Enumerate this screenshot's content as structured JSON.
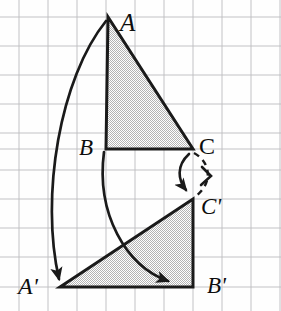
{
  "figure": {
    "width": 281,
    "height": 311,
    "background_color": "#fefefe",
    "grid": {
      "spacing": 29,
      "origin_x": 19,
      "origin_y": 17,
      "line_color": "#b9b9bd",
      "line_width": 0.9,
      "visible": true
    },
    "style": {
      "stroke_color": "#1a1a1a",
      "shape_stroke_width": 3.0,
      "arc_stroke_width": 2.6,
      "fill_color": "#d9d9d9",
      "fill_pattern": "checker-dither",
      "dash_pattern": "6 5"
    },
    "points": {
      "A": {
        "label": "A",
        "x": 108,
        "y": 17
      },
      "B": {
        "label": "B",
        "x": 106,
        "y": 149
      },
      "C": {
        "label": "C",
        "x": 193,
        "y": 149
      },
      "Ap": {
        "label": "A'",
        "x": 60,
        "y": 287
      },
      "Bp": {
        "label": "B'",
        "x": 193,
        "y": 287
      },
      "Cp": {
        "label": "C'",
        "x": 193,
        "y": 199
      }
    },
    "shapes": [
      {
        "name": "triangle-abc",
        "vertices": [
          "A",
          "B",
          "C"
        ],
        "filled": true
      },
      {
        "name": "triangle-apbpcp",
        "vertices": [
          "Ap",
          "Bp",
          "Cp"
        ],
        "filled": true
      }
    ],
    "arrows": [
      {
        "name": "arc-a-to-ap",
        "from": "A",
        "to": "Ap",
        "style": "solid",
        "arrowhead": "filled"
      },
      {
        "name": "arc-b-to-bp",
        "from": "B",
        "to": "Bp",
        "style": "solid",
        "arrowhead": "filled"
      },
      {
        "name": "arc-c-to-cp",
        "from": "C",
        "to": "Cp",
        "style": "solid",
        "arrowhead": "filled"
      },
      {
        "name": "arc-c-to-cp-dashed",
        "from": "C",
        "to": "Cp",
        "style": "dashed",
        "arrowhead": "open-chevron"
      }
    ]
  }
}
